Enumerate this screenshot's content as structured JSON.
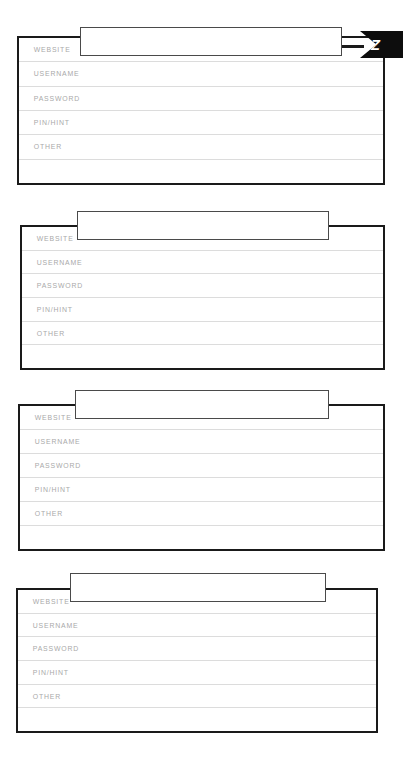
{
  "document": {
    "kind": "password-log-worksheet",
    "background_color": "#ffffff",
    "card_border_color": "#1a1a1a",
    "rule_line_color": "#dcdcdc",
    "label_color": "#a9a9a9",
    "ribbon_color": "#0d0d0d",
    "ribbon_letter_color": "#ffffff"
  },
  "row_labels": {
    "website": "WEBSITE",
    "username": "USERNAME",
    "password": "PASSWORD",
    "pin_hint": "PIN/HINT",
    "other": "OTHER",
    "blank": ""
  },
  "index_tab": {
    "letter": "Z"
  },
  "cards": [
    {
      "id": "card-1",
      "title_value": "",
      "title_placeholder": "",
      "has_index_tab": true,
      "rows": [
        {
          "label": "WEBSITE",
          "value": ""
        },
        {
          "label": "USERNAME",
          "value": ""
        },
        {
          "label": "PASSWORD",
          "value": ""
        },
        {
          "label": "PIN/HINT",
          "value": ""
        },
        {
          "label": "OTHER",
          "value": ""
        },
        {
          "label": "",
          "value": ""
        }
      ]
    },
    {
      "id": "card-2",
      "title_value": "",
      "title_placeholder": "",
      "has_index_tab": false,
      "rows": [
        {
          "label": "WEBSITE",
          "value": ""
        },
        {
          "label": "USERNAME",
          "value": ""
        },
        {
          "label": "PASSWORD",
          "value": ""
        },
        {
          "label": "PIN/HINT",
          "value": ""
        },
        {
          "label": "OTHER",
          "value": ""
        },
        {
          "label": "",
          "value": ""
        }
      ]
    },
    {
      "id": "card-3",
      "title_value": "",
      "title_placeholder": "",
      "has_index_tab": false,
      "rows": [
        {
          "label": "WEBSITE",
          "value": ""
        },
        {
          "label": "USERNAME",
          "value": ""
        },
        {
          "label": "PASSWORD",
          "value": ""
        },
        {
          "label": "PIN/HINT",
          "value": ""
        },
        {
          "label": "OTHER",
          "value": ""
        },
        {
          "label": "",
          "value": ""
        }
      ]
    },
    {
      "id": "card-4",
      "title_value": "",
      "title_placeholder": "",
      "has_index_tab": false,
      "rows": [
        {
          "label": "WEBSITE",
          "value": ""
        },
        {
          "label": "USERNAME",
          "value": ""
        },
        {
          "label": "PASSWORD",
          "value": ""
        },
        {
          "label": "PIN/HINT",
          "value": ""
        },
        {
          "label": "OTHER",
          "value": ""
        },
        {
          "label": "",
          "value": ""
        }
      ]
    }
  ]
}
